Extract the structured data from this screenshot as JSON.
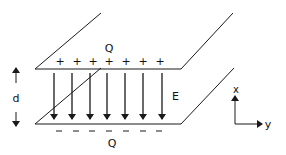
{
  "diagram": {
    "top_plate": {
      "charge_label": "Q",
      "sign_symbol": "+",
      "sign_count": 7
    },
    "bottom_plate": {
      "charge_label": "Q",
      "sign_symbol": "−",
      "sign_count": 7
    },
    "field_label": "E",
    "field_arrow_count": 7,
    "separation_label": "d",
    "axes": {
      "vertical_label": "x",
      "horizontal_label": "y"
    },
    "colors": {
      "line": "#1a1a1a",
      "background": "#ffffff"
    }
  }
}
